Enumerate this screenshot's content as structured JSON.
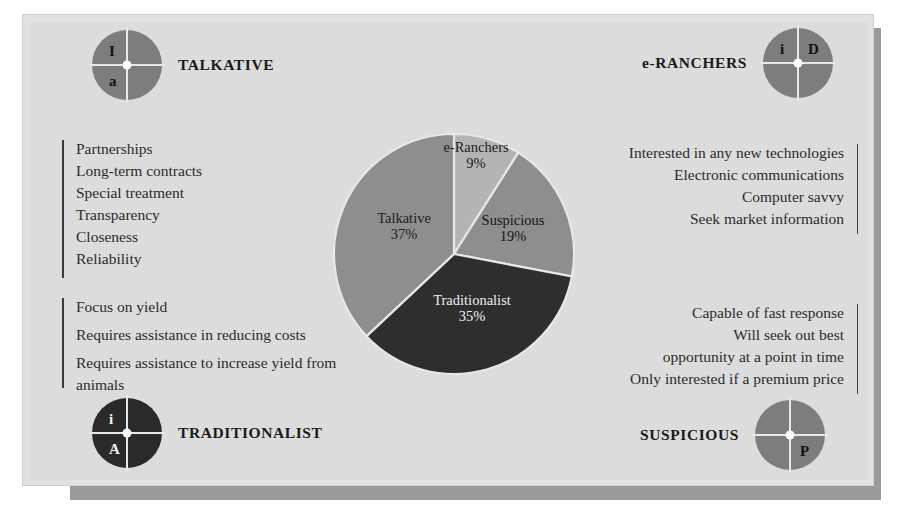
{
  "badges": [
    {
      "id": "talkative",
      "label": "TALKATIVE",
      "tone": "mid",
      "position": "top-left",
      "quadrants": {
        "tl": "I",
        "tr": "",
        "bl": "a",
        "br": ""
      }
    },
    {
      "id": "e-ranchers",
      "label": "e-RANCHERS",
      "tone": "mid",
      "position": "top-right",
      "quadrants": {
        "tl": "i",
        "tr": "D",
        "bl": "",
        "br": ""
      }
    },
    {
      "id": "traditionalist",
      "label": "TRADITIONALIST",
      "tone": "dark",
      "position": "bottom-left",
      "quadrants": {
        "tl": "i",
        "tr": "",
        "bl": "A",
        "br": ""
      }
    },
    {
      "id": "suspicious",
      "label": "SUSPICIOUS",
      "tone": "mid",
      "position": "bottom-right",
      "quadrants": {
        "tl": "",
        "tr": "",
        "bl": "",
        "br": "P"
      }
    }
  ],
  "lists": {
    "talkative_traits": [
      "Partnerships",
      "Long-term contracts",
      "Special treatment",
      "Transparency",
      "Closeness",
      "Reliability"
    ],
    "traditionalist_traits": [
      "Focus on yield",
      "Requires assistance in reducing costs",
      "Requires assistance to increase yield from animals"
    ],
    "eranchers_traits": [
      "Interested in any new technologies",
      "Electronic communications",
      "Computer savvy",
      "Seek market information"
    ],
    "suspicious_traits": [
      "Capable of fast response",
      "Will seek out best",
      "opportunity at a point in time",
      "Only interested if a premium price"
    ]
  },
  "chart_data": {
    "type": "pie",
    "title": "",
    "labels": [
      "e-Ranchers",
      "Suspicious",
      "Traditionalist",
      "Talkative"
    ],
    "values": [
      9,
      19,
      35,
      37
    ],
    "value_suffix": "%",
    "start_angle_deg": 0,
    "direction": "clockwise",
    "legend": "none",
    "colors": [
      "#b4b4b4",
      "#8e8e8e",
      "#2e2e2e",
      "#8e8e8e"
    ],
    "slice_text": [
      {
        "name": "e-Ranchers",
        "pct": "9%"
      },
      {
        "name": "Suspicious",
        "pct": "19%"
      },
      {
        "name": "Traditionalist",
        "pct": "35%"
      },
      {
        "name": "Talkative",
        "pct": "37%"
      }
    ]
  },
  "colors": {
    "panel": "#dcdcdc",
    "panel_outer": "#e2e2e2",
    "shadow": "#9a9a9a",
    "badge_mid": "#7d7d7d",
    "badge_dark": "#2a2a2a",
    "text": "#2b2b2b",
    "slice_light": "#b4b4b4",
    "slice_mid": "#8e8e8e",
    "slice_dark": "#2e2e2e"
  }
}
